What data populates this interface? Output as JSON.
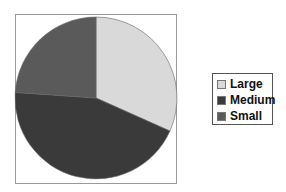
{
  "chart_data": {
    "type": "pie",
    "title": "",
    "categories": [
      "Large",
      "Medium",
      "Small"
    ],
    "values": [
      31.7,
      44.4,
      23.9
    ],
    "colors": [
      "#d9d9d9",
      "#3a3a3a",
      "#5a5a5a"
    ],
    "start_angle_deg": 0,
    "direction": "clockwise",
    "legend_position": "right",
    "grid": false
  },
  "legend": {
    "items": [
      {
        "label": "Large",
        "color": "#d9d9d9"
      },
      {
        "label": "Medium",
        "color": "#3a3a3a"
      },
      {
        "label": "Small",
        "color": "#5a5a5a"
      }
    ]
  }
}
